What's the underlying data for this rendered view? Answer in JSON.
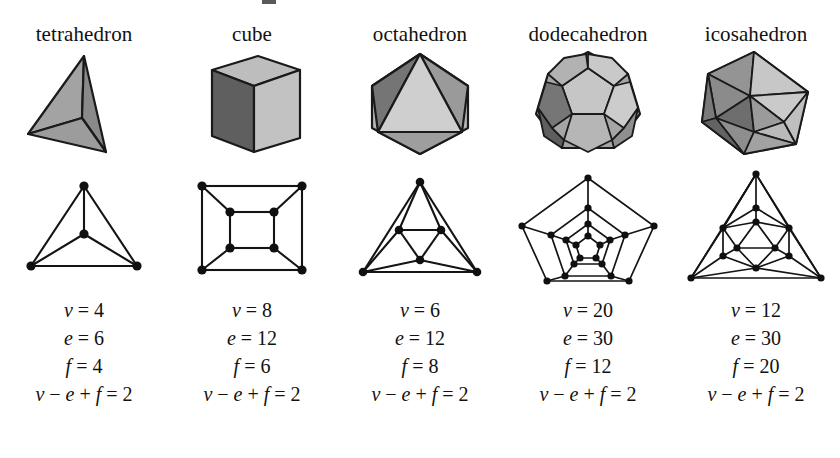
{
  "figure": {
    "title": "",
    "background_color": "#ffffff",
    "ink_color": "#141414"
  },
  "palette": {
    "face_light": "#c9c9c9",
    "face_mid": "#a8a8a8",
    "face_dark": "#6f6f6f",
    "face_darker": "#5a5a5a",
    "outline": "#1a1a1a"
  },
  "symbols": {
    "v": "v",
    "e": "e",
    "f": "f",
    "equals": "=",
    "minus": "−",
    "plus": "+"
  },
  "columns": [
    {
      "label": "tetrahedron",
      "solid_icon": "tetrahedron-solid-icon",
      "graph_icon": "tetrahedron-graph-icon",
      "vertices": 4,
      "edges": 6,
      "faces": 4,
      "euler": 2,
      "lines": {
        "v": "v = 4",
        "e": "e = 6",
        "f": "f = 4",
        "euler": "v − e + f = 2"
      }
    },
    {
      "label": "cube",
      "solid_icon": "cube-solid-icon",
      "graph_icon": "cube-graph-icon",
      "vertices": 8,
      "edges": 12,
      "faces": 6,
      "euler": 2,
      "lines": {
        "v": "v = 8",
        "e": "e = 12",
        "f": "f = 6",
        "euler": "v − e + f = 2"
      }
    },
    {
      "label": "octahedron",
      "solid_icon": "octahedron-solid-icon",
      "graph_icon": "octahedron-graph-icon",
      "vertices": 6,
      "edges": 12,
      "faces": 8,
      "euler": 2,
      "lines": {
        "v": "v = 6",
        "e": "e = 12",
        "f": "f = 8",
        "euler": "v − e + f = 2"
      }
    },
    {
      "label": "dodecahedron",
      "solid_icon": "dodecahedron-solid-icon",
      "graph_icon": "dodecahedron-graph-icon",
      "vertices": 20,
      "edges": 30,
      "faces": 12,
      "euler": 2,
      "lines": {
        "v": "v = 20",
        "e": "e = 30",
        "f": "f = 12",
        "euler": "v − e + f = 2"
      }
    },
    {
      "label": "icosahedron",
      "solid_icon": "icosahedron-solid-icon",
      "graph_icon": "icosahedron-graph-icon",
      "vertices": 12,
      "edges": 30,
      "faces": 20,
      "euler": 2,
      "lines": {
        "v": "v = 12",
        "e": "e = 30",
        "f": "f = 20",
        "euler": "v − e + f = 2"
      }
    }
  ]
}
